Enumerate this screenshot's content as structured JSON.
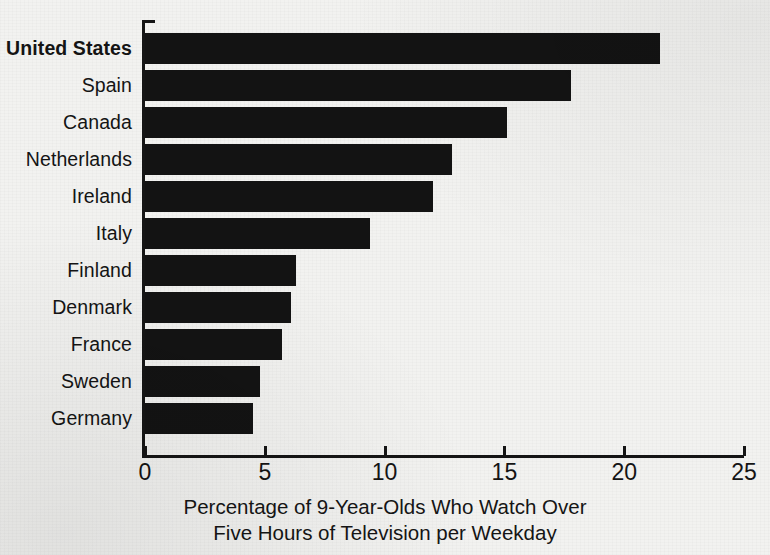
{
  "chart_data": {
    "type": "bar",
    "orientation": "horizontal",
    "title": "",
    "subtitle": "",
    "xlabel": "Percentage of 9-Year-Olds Who Watch Over Five Hours of Television per Weekday",
    "ylabel": "",
    "categories": [
      "United States",
      "Spain",
      "Canada",
      "Netherlands",
      "Ireland",
      "Italy",
      "Finland",
      "Denmark",
      "France",
      "Sweden",
      "Germany"
    ],
    "values": [
      21.5,
      17.8,
      15.1,
      12.8,
      12.0,
      9.4,
      6.3,
      6.1,
      5.7,
      4.8,
      4.5
    ],
    "emphasis_category": "United States",
    "xlim": [
      0,
      25
    ],
    "xticks": [
      0,
      5,
      10,
      15,
      20,
      25
    ],
    "xtick_labels": [
      "0",
      "5",
      "10",
      "15",
      "20",
      "25"
    ],
    "grid": false,
    "legend": false,
    "bar_color": "#131313",
    "background_color": "#f2f2f0",
    "axis_color": "#151515"
  },
  "caption": {
    "line1": "Percentage of 9-Year-Olds Who Watch Over",
    "line2": "Five Hours of Television per Weekday"
  }
}
